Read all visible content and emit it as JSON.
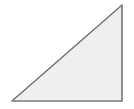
{
  "canvas": {
    "width": 134,
    "height": 109,
    "background_color": "#ffffff",
    "name": "shape-canvas"
  },
  "shape": {
    "kind": "right-triangle",
    "label": "right triangle",
    "orientation": "right-angle-at-bottom-right",
    "fill_color": "#efefef",
    "stroke_color": "#808080",
    "stroke_width": 1.2,
    "shadow_color": "#d8d8d8",
    "shadow_offset_x": 1,
    "shadow_offset_y": 1,
    "vertices": [
      {
        "name": "bottom-left",
        "x": 12,
        "y": 101
      },
      {
        "name": "bottom-right",
        "x": 122,
        "y": 101
      },
      {
        "name": "top-right",
        "x": 122,
        "y": 5
      }
    ],
    "points_attr": "12,101 122,101 122,5",
    "shadow_points_attr": "13,102 123,102 123,6",
    "edges": [
      {
        "name": "bottom-edge",
        "from": "bottom-left",
        "to": "bottom-right"
      },
      {
        "name": "right-edge",
        "from": "bottom-right",
        "to": "top-right"
      },
      {
        "name": "hypotenuse-edge",
        "from": "top-right",
        "to": "bottom-left"
      }
    ]
  }
}
